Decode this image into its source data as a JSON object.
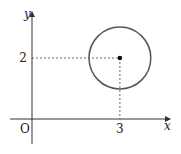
{
  "diagram": {
    "type": "coordinate-plane-circle",
    "axes": {
      "x_label": "x",
      "y_label": "y",
      "origin_label": "O"
    },
    "center": {
      "x": 3,
      "y": 2
    },
    "radius": 1,
    "tick_labels": {
      "x": "3",
      "y": "2"
    },
    "guides": "dashed lines from center to both axes",
    "colors": {
      "axis": "#333333",
      "circle": "#555555",
      "guide": "#444444",
      "point": "#000000"
    }
  }
}
